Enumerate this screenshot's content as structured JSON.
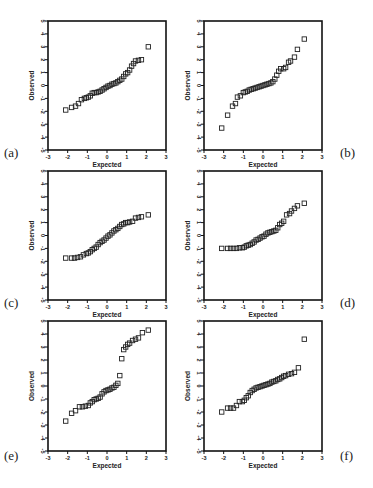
{
  "figure": {
    "panels": [
      "a",
      "b",
      "c",
      "d",
      "e",
      "f"
    ]
  },
  "chart_data": [
    {
      "id": "a",
      "panel_label": "(a)",
      "type": "scatter",
      "title": "",
      "xlabel": "Expected",
      "ylabel": "Observed",
      "xlim": [
        -3,
        3
      ],
      "ylim": [
        -5,
        5
      ],
      "xticks": [
        "-3",
        "-2",
        "-1",
        "0",
        "1",
        "2",
        "3"
      ],
      "yticks": [
        "-5",
        "-4",
        "-3",
        "-2",
        "-1",
        "0",
        "1",
        "2",
        "3",
        "4",
        "5"
      ],
      "grid": false,
      "marker": "open-square",
      "points": [
        [
          -2.1,
          -1.9
        ],
        [
          -1.8,
          -1.7
        ],
        [
          -1.6,
          -1.6
        ],
        [
          -1.45,
          -1.4
        ],
        [
          -1.3,
          -1.1
        ],
        [
          -1.15,
          -1.0
        ],
        [
          -1.05,
          -0.95
        ],
        [
          -0.95,
          -0.9
        ],
        [
          -0.85,
          -0.8
        ],
        [
          -0.75,
          -0.6
        ],
        [
          -0.65,
          -0.55
        ],
        [
          -0.55,
          -0.55
        ],
        [
          -0.45,
          -0.5
        ],
        [
          -0.35,
          -0.45
        ],
        [
          -0.25,
          -0.35
        ],
        [
          -0.15,
          -0.25
        ],
        [
          -0.05,
          -0.15
        ],
        [
          0.05,
          -0.05
        ],
        [
          0.15,
          0.0
        ],
        [
          0.25,
          0.1
        ],
        [
          0.35,
          0.15
        ],
        [
          0.45,
          0.2
        ],
        [
          0.55,
          0.3
        ],
        [
          0.65,
          0.4
        ],
        [
          0.75,
          0.5
        ],
        [
          0.85,
          0.7
        ],
        [
          0.95,
          0.9
        ],
        [
          1.05,
          1.0
        ],
        [
          1.15,
          1.2
        ],
        [
          1.25,
          1.5
        ],
        [
          1.35,
          1.7
        ],
        [
          1.45,
          1.9
        ],
        [
          1.6,
          1.95
        ],
        [
          1.75,
          2.0
        ],
        [
          2.1,
          3.0
        ]
      ]
    },
    {
      "id": "b",
      "panel_label": "(b)",
      "type": "scatter",
      "title": "",
      "xlabel": "Expected",
      "ylabel": "Observed",
      "xlim": [
        -3,
        3
      ],
      "ylim": [
        -5,
        5
      ],
      "xticks": [
        "-3",
        "-2",
        "-1",
        "0",
        "1",
        "2",
        "3"
      ],
      "yticks": [
        "-5",
        "-4",
        "-3",
        "-2",
        "-1",
        "0",
        "1",
        "2",
        "3",
        "4",
        "5"
      ],
      "grid": false,
      "marker": "open-square",
      "points": [
        [
          -2.1,
          -3.3
        ],
        [
          -1.8,
          -2.3
        ],
        [
          -1.55,
          -1.6
        ],
        [
          -1.4,
          -1.4
        ],
        [
          -1.3,
          -0.9
        ],
        [
          -1.15,
          -0.8
        ],
        [
          -1.0,
          -0.55
        ],
        [
          -0.9,
          -0.5
        ],
        [
          -0.8,
          -0.45
        ],
        [
          -0.7,
          -0.35
        ],
        [
          -0.6,
          -0.3
        ],
        [
          -0.5,
          -0.25
        ],
        [
          -0.4,
          -0.2
        ],
        [
          -0.3,
          -0.15
        ],
        [
          -0.2,
          -0.1
        ],
        [
          -0.1,
          -0.05
        ],
        [
          0.0,
          0.0
        ],
        [
          0.1,
          0.05
        ],
        [
          0.2,
          0.1
        ],
        [
          0.3,
          0.15
        ],
        [
          0.4,
          0.2
        ],
        [
          0.5,
          0.3
        ],
        [
          0.6,
          0.5
        ],
        [
          0.7,
          0.8
        ],
        [
          0.8,
          1.1
        ],
        [
          0.9,
          1.3
        ],
        [
          1.05,
          1.3
        ],
        [
          1.15,
          1.4
        ],
        [
          1.3,
          1.8
        ],
        [
          1.4,
          1.9
        ],
        [
          1.6,
          2.2
        ],
        [
          1.75,
          2.8
        ],
        [
          2.1,
          3.6
        ]
      ]
    },
    {
      "id": "c",
      "panel_label": "(c)",
      "type": "scatter",
      "title": "",
      "xlabel": "Expected",
      "ylabel": "Observed",
      "xlim": [
        -3,
        3
      ],
      "ylim": [
        -5,
        5
      ],
      "xticks": [
        "-3",
        "-2",
        "-1",
        "0",
        "1",
        "2",
        "3"
      ],
      "yticks": [
        "-5",
        "-4",
        "-3",
        "-2",
        "-1",
        "0",
        "1",
        "2",
        "3",
        "4",
        "5"
      ],
      "grid": false,
      "marker": "open-square",
      "points": [
        [
          -2.1,
          -1.75
        ],
        [
          -1.8,
          -1.75
        ],
        [
          -1.65,
          -1.75
        ],
        [
          -1.5,
          -1.7
        ],
        [
          -1.35,
          -1.65
        ],
        [
          -1.2,
          -1.5
        ],
        [
          -1.05,
          -1.4
        ],
        [
          -0.95,
          -1.35
        ],
        [
          -0.85,
          -1.25
        ],
        [
          -0.75,
          -1.1
        ],
        [
          -0.65,
          -1.0
        ],
        [
          -0.55,
          -0.9
        ],
        [
          -0.45,
          -0.7
        ],
        [
          -0.35,
          -0.55
        ],
        [
          -0.25,
          -0.45
        ],
        [
          -0.15,
          -0.35
        ],
        [
          -0.05,
          -0.2
        ],
        [
          0.05,
          -0.05
        ],
        [
          0.15,
          0.05
        ],
        [
          0.25,
          0.2
        ],
        [
          0.35,
          0.35
        ],
        [
          0.45,
          0.45
        ],
        [
          0.55,
          0.55
        ],
        [
          0.65,
          0.7
        ],
        [
          0.75,
          0.85
        ],
        [
          0.85,
          0.9
        ],
        [
          0.95,
          1.0
        ],
        [
          1.05,
          1.0
        ],
        [
          1.15,
          1.05
        ],
        [
          1.3,
          1.1
        ],
        [
          1.45,
          1.35
        ],
        [
          1.6,
          1.4
        ],
        [
          1.75,
          1.45
        ],
        [
          2.1,
          1.6
        ]
      ]
    },
    {
      "id": "d",
      "panel_label": "(d)",
      "type": "scatter",
      "title": "",
      "xlabel": "Expected",
      "ylabel": "Observed",
      "xlim": [
        -3,
        3
      ],
      "ylim": [
        -5,
        5
      ],
      "xticks": [
        "-3",
        "-2",
        "-1",
        "0",
        "1",
        "2",
        "3"
      ],
      "yticks": [
        "-5",
        "-4",
        "-3",
        "-2",
        "-1",
        "0",
        "1",
        "2",
        "3",
        "4",
        "5"
      ],
      "grid": false,
      "marker": "open-square",
      "points": [
        [
          -2.1,
          -1.0
        ],
        [
          -1.8,
          -1.0
        ],
        [
          -1.65,
          -1.0
        ],
        [
          -1.5,
          -1.0
        ],
        [
          -1.35,
          -1.0
        ],
        [
          -1.2,
          -0.95
        ],
        [
          -1.05,
          -0.95
        ],
        [
          -0.95,
          -0.9
        ],
        [
          -0.85,
          -0.8
        ],
        [
          -0.75,
          -0.75
        ],
        [
          -0.65,
          -0.7
        ],
        [
          -0.55,
          -0.6
        ],
        [
          -0.45,
          -0.5
        ],
        [
          -0.35,
          -0.35
        ],
        [
          -0.25,
          -0.3
        ],
        [
          -0.15,
          -0.2
        ],
        [
          -0.05,
          -0.1
        ],
        [
          0.05,
          -0.05
        ],
        [
          0.15,
          0.1
        ],
        [
          0.25,
          0.2
        ],
        [
          0.35,
          0.25
        ],
        [
          0.45,
          0.3
        ],
        [
          0.55,
          0.35
        ],
        [
          0.65,
          0.4
        ],
        [
          0.75,
          0.6
        ],
        [
          0.85,
          0.85
        ],
        [
          0.95,
          0.95
        ],
        [
          1.05,
          1.1
        ],
        [
          1.2,
          1.6
        ],
        [
          1.35,
          1.7
        ],
        [
          1.45,
          1.9
        ],
        [
          1.6,
          2.1
        ],
        [
          1.75,
          2.3
        ],
        [
          2.1,
          2.5
        ]
      ]
    },
    {
      "id": "e",
      "panel_label": "(e)",
      "type": "scatter",
      "title": "",
      "xlabel": "Expected",
      "ylabel": "Observed",
      "xlim": [
        -3,
        3
      ],
      "ylim": [
        -5,
        5
      ],
      "xticks": [
        "-3",
        "-2",
        "-1",
        "0",
        "1",
        "2",
        "3"
      ],
      "yticks": [
        "-5",
        "-4",
        "-3",
        "-2",
        "-1",
        "0",
        "1",
        "2",
        "3",
        "4",
        "5"
      ],
      "grid": false,
      "marker": "open-square",
      "points": [
        [
          -2.1,
          -2.7
        ],
        [
          -1.8,
          -2.1
        ],
        [
          -1.6,
          -1.9
        ],
        [
          -1.4,
          -1.6
        ],
        [
          -1.25,
          -1.6
        ],
        [
          -1.1,
          -1.55
        ],
        [
          -0.95,
          -1.5
        ],
        [
          -0.85,
          -1.3
        ],
        [
          -0.75,
          -1.2
        ],
        [
          -0.65,
          -1.05
        ],
        [
          -0.55,
          -1.0
        ],
        [
          -0.45,
          -0.95
        ],
        [
          -0.35,
          -0.85
        ],
        [
          -0.25,
          -0.6
        ],
        [
          -0.15,
          -0.45
        ],
        [
          -0.05,
          -0.35
        ],
        [
          0.05,
          -0.3
        ],
        [
          0.15,
          -0.25
        ],
        [
          0.25,
          -0.15
        ],
        [
          0.35,
          -0.1
        ],
        [
          0.45,
          0.05
        ],
        [
          0.55,
          0.2
        ],
        [
          0.65,
          0.8
        ],
        [
          0.75,
          2.1
        ],
        [
          0.85,
          2.8
        ],
        [
          0.95,
          3.0
        ],
        [
          1.05,
          3.2
        ],
        [
          1.15,
          3.3
        ],
        [
          1.3,
          3.5
        ],
        [
          1.45,
          3.6
        ],
        [
          1.6,
          3.7
        ],
        [
          1.8,
          4.1
        ],
        [
          2.1,
          4.3
        ]
      ]
    },
    {
      "id": "f",
      "panel_label": "(f)",
      "type": "scatter",
      "title": "",
      "xlabel": "Expected",
      "ylabel": "Observed",
      "xlim": [
        -3,
        3
      ],
      "ylim": [
        -5,
        5
      ],
      "xticks": [
        "-3",
        "-2",
        "-1",
        "0",
        "1",
        "2",
        "3"
      ],
      "yticks": [
        "-5",
        "-4",
        "-3",
        "-2",
        "-1",
        "0",
        "1",
        "2",
        "3",
        "4",
        "5"
      ],
      "grid": false,
      "marker": "open-square",
      "points": [
        [
          -2.1,
          -2.0
        ],
        [
          -1.8,
          -1.7
        ],
        [
          -1.65,
          -1.7
        ],
        [
          -1.5,
          -1.7
        ],
        [
          -1.35,
          -1.5
        ],
        [
          -1.2,
          -1.2
        ],
        [
          -1.05,
          -1.2
        ],
        [
          -0.95,
          -1.1
        ],
        [
          -0.85,
          -0.9
        ],
        [
          -0.75,
          -0.75
        ],
        [
          -0.65,
          -0.5
        ],
        [
          -0.55,
          -0.35
        ],
        [
          -0.45,
          -0.25
        ],
        [
          -0.35,
          -0.15
        ],
        [
          -0.25,
          -0.1
        ],
        [
          -0.15,
          -0.05
        ],
        [
          -0.05,
          0.0
        ],
        [
          0.05,
          0.05
        ],
        [
          0.15,
          0.1
        ],
        [
          0.25,
          0.15
        ],
        [
          0.35,
          0.2
        ],
        [
          0.45,
          0.3
        ],
        [
          0.55,
          0.35
        ],
        [
          0.65,
          0.4
        ],
        [
          0.75,
          0.5
        ],
        [
          0.85,
          0.55
        ],
        [
          0.95,
          0.65
        ],
        [
          1.05,
          0.75
        ],
        [
          1.15,
          0.8
        ],
        [
          1.3,
          0.9
        ],
        [
          1.45,
          0.95
        ],
        [
          1.6,
          1.05
        ],
        [
          1.8,
          1.4
        ],
        [
          2.1,
          3.6
        ]
      ]
    }
  ]
}
